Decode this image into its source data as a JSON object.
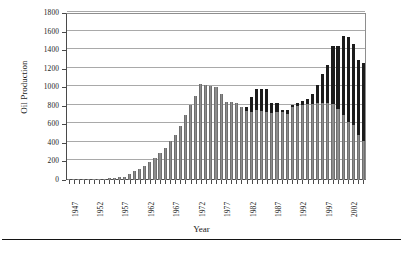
{
  "chart_data": {
    "type": "bar",
    "stacked": true,
    "title": "",
    "xlabel": "Year",
    "ylabel": "Oil Production",
    "ylim": [
      0,
      1800
    ],
    "ytick_values": [
      0,
      200,
      400,
      600,
      800,
      1000,
      1200,
      1400,
      1600,
      1800
    ],
    "ytick_labels": [
      "0",
      "200",
      "400",
      "600",
      "800",
      "1000",
      "1200",
      "1400",
      "1600",
      "1800"
    ],
    "xtick_labels": [
      "1947",
      "1952",
      "1957",
      "1962",
      "1967",
      "1972",
      "1977",
      "1982",
      "1987",
      "1992",
      "1997",
      "2002"
    ],
    "grid": "horizontal",
    "legend": "none",
    "colors": {
      "series_lower": "#8d8d8d",
      "series_upper": "#1c1c1c",
      "grid": "#a9a9a9",
      "axis": "#4a4a4a"
    },
    "categories": [
      1947,
      1948,
      1949,
      1950,
      1951,
      1952,
      1953,
      1954,
      1955,
      1956,
      1957,
      1958,
      1959,
      1960,
      1961,
      1962,
      1963,
      1964,
      1965,
      1966,
      1967,
      1968,
      1969,
      1970,
      1971,
      1972,
      1973,
      1974,
      1975,
      1976,
      1977,
      1978,
      1979,
      1980,
      1981,
      1982,
      1983,
      1984,
      1985,
      1986,
      1987,
      1988,
      1989,
      1990,
      1991,
      1992,
      1993,
      1994,
      1995,
      1996,
      1997,
      1998,
      1999,
      2000,
      2001,
      2002,
      2003,
      2004,
      2005
    ],
    "series": [
      {
        "name": "lower",
        "values": [
          4,
          5,
          6,
          8,
          10,
          12,
          14,
          16,
          20,
          24,
          30,
          36,
          60,
          95,
          120,
          150,
          190,
          240,
          290,
          345,
          420,
          480,
          580,
          705,
          810,
          905,
          1030,
          1025,
          1010,
          1005,
          925,
          845,
          840,
          825,
          790,
          745,
          735,
          755,
          740,
          735,
          725,
          730,
          735,
          715,
          790,
          800,
          805,
          815,
          820,
          825,
          830,
          835,
          820,
          765,
          700,
          620,
          595,
          490,
          420
        ]
      },
      {
        "name": "upper",
        "values": [
          0,
          0,
          0,
          0,
          0,
          0,
          0,
          0,
          0,
          0,
          0,
          0,
          0,
          0,
          0,
          0,
          0,
          0,
          0,
          0,
          0,
          0,
          0,
          0,
          0,
          0,
          0,
          0,
          0,
          0,
          0,
          0,
          0,
          0,
          0,
          40,
          155,
          230,
          240,
          250,
          110,
          100,
          20,
          40,
          20,
          30,
          45,
          55,
          110,
          195,
          310,
          405,
          620,
          675,
          855,
          925,
          870,
          800,
          845
        ]
      }
    ]
  },
  "axes": {
    "y_title": "Oil Production",
    "x_title": "Year"
  },
  "footer": {
    "caption": ""
  }
}
